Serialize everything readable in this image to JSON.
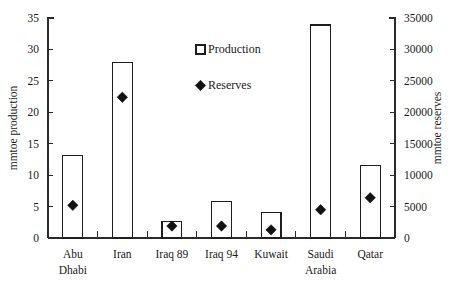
{
  "chart_data": {
    "type": "bar",
    "title": "",
    "subtitle": "",
    "xlabel": "",
    "ylabel": "mmtoe production",
    "y2label": "mmtoe reserves",
    "categories": [
      "Abu Dhabi",
      "Iran",
      "Iraq 89",
      "Iraq 94",
      "Kuwait",
      "Saudi Arabia",
      "Qatar"
    ],
    "category_lines": [
      [
        "Abu",
        "Dhabi"
      ],
      [
        "Iran"
      ],
      [
        "Iraq 89"
      ],
      [
        "Iraq 94"
      ],
      [
        "Kuwait"
      ],
      [
        "Saudi",
        "Arabia"
      ],
      [
        "Qatar"
      ]
    ],
    "series": [
      {
        "name": "Production",
        "marker": "open-square",
        "axis": "left",
        "unit": "mmtoe",
        "values": [
          13.1,
          27.9,
          2.6,
          5.8,
          4.1,
          33.9,
          11.5
        ]
      },
      {
        "name": "Reserves",
        "marker": "filled-diamond",
        "axis": "right",
        "unit": "mmtoe",
        "values": [
          5200,
          22400,
          1900,
          1900,
          1300,
          4500,
          6400
        ]
      }
    ],
    "ylim": [
      0,
      35
    ],
    "yticks": [
      0,
      5,
      10,
      15,
      20,
      25,
      30,
      35
    ],
    "ytick_labels": [
      "0",
      "5",
      "10",
      "15",
      "20",
      "25",
      "30",
      "35"
    ],
    "y2lim": [
      0,
      35000
    ],
    "y2ticks": [
      0,
      5000,
      10000,
      15000,
      20000,
      25000,
      30000,
      35000
    ],
    "y2tick_labels": [
      "0",
      "5000",
      "10000",
      "15000",
      "20000",
      "25000",
      "30000",
      "35000"
    ],
    "grid": false,
    "legend_position": "inside-top-center",
    "legend": [
      {
        "label": "Production",
        "marker": "open-square"
      },
      {
        "label": "Reserves",
        "marker": "filled-diamond"
      }
    ],
    "colors": {
      "bar_fill": "#ffffff",
      "bar_stroke": "#1e1e1e",
      "marker": "#111111",
      "axis": "#2b2b2b",
      "text": "#1a1a1a",
      "background": "#ffffff"
    }
  }
}
